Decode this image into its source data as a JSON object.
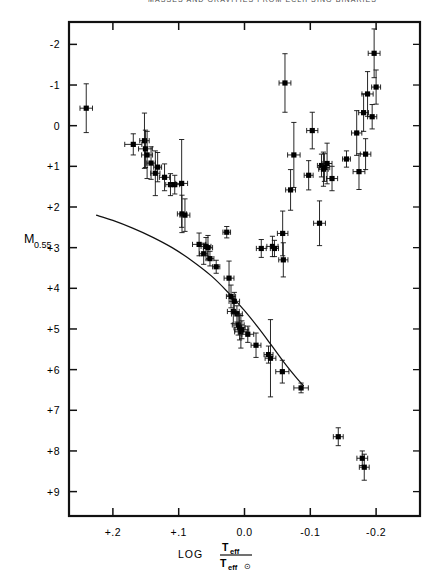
{
  "figure": {
    "running_head": "MASSES AND GRAVITIES FROM ECLIPSING BINARIES",
    "caption": ""
  },
  "axes": {
    "y_label_main": "M",
    "y_label_sub": "0.55",
    "x_label_prefix": "LOG",
    "x_label_num_main": "T",
    "x_label_num_sub": "eff",
    "x_label_den_main": "T",
    "x_label_den_sub": "eff",
    "x_label_den_sun": "⊙",
    "y_ticks": [
      "-2",
      "-1",
      "0",
      "+1",
      "+2",
      "+3",
      "+4",
      "+5",
      "+6",
      "+7",
      "+8",
      "+9"
    ],
    "x_ticks": [
      "+.2",
      "+.1",
      "0.0",
      "-0.1",
      "-0.2"
    ]
  },
  "chart_data": {
    "type": "scatter",
    "title": "",
    "xlabel": "LOG Teff/Teff⊙",
    "ylabel": "M0.55",
    "xlim": [
      0.2667,
      -0.2667
    ],
    "ylim": [
      -2.55,
      9.6
    ],
    "y_inverted": true,
    "grid": false,
    "legend": null,
    "x_tick_values": [
      0.2,
      0.1,
      0.0,
      -0.1,
      -0.2
    ],
    "y_tick_values": [
      -2,
      -1,
      0,
      1,
      2,
      3,
      4,
      5,
      6,
      7,
      8,
      9
    ],
    "series": [
      {
        "name": "eclipsing binaries",
        "marker": "filled-square-with-errorbars",
        "points": [
          {
            "x": 0.2405,
            "y": -0.43,
            "xerr": 0.0095,
            "yerr": 0.6
          },
          {
            "x": 0.169,
            "y": 0.46,
            "xerr": 0.013,
            "yerr": 0.26
          },
          {
            "x": 0.152,
            "y": 0.37,
            "xerr": 0.0072,
            "yerr": 0.68
          },
          {
            "x": 0.1505,
            "y": 0.57,
            "xerr": 0.0105,
            "yerr": 0.46
          },
          {
            "x": 0.148,
            "y": 0.72,
            "xerr": 0.0083,
            "yerr": 0.58
          },
          {
            "x": 0.142,
            "y": 0.92,
            "xerr": 0.0065,
            "yerr": 0.4
          },
          {
            "x": 0.1355,
            "y": 1.17,
            "xerr": 0.007,
            "yerr": 0.55
          },
          {
            "x": 0.132,
            "y": 1.02,
            "xerr": 0.006,
            "yerr": 0.36
          },
          {
            "x": 0.1215,
            "y": 1.27,
            "xerr": 0.0078,
            "yerr": 0.33
          },
          {
            "x": 0.1125,
            "y": 1.45,
            "xerr": 0.0072,
            "yerr": 0.27
          },
          {
            "x": 0.106,
            "y": 1.45,
            "xerr": 0.0075,
            "yerr": 0.23
          },
          {
            "x": 0.0955,
            "y": 1.42,
            "xerr": 0.009,
            "yerr": 1.08
          },
          {
            "x": 0.095,
            "y": 2.17,
            "xerr": 0.007,
            "yerr": 0.46
          },
          {
            "x": 0.0905,
            "y": 2.2,
            "xerr": 0.0075,
            "yerr": 0.4
          },
          {
            "x": 0.069,
            "y": 2.92,
            "xerr": 0.01,
            "yerr": 0.28
          },
          {
            "x": 0.062,
            "y": 3.15,
            "xerr": 0.0062,
            "yerr": 0.26
          },
          {
            "x": 0.0585,
            "y": 2.97,
            "xerr": 0.0075,
            "yerr": 0.22
          },
          {
            "x": 0.0555,
            "y": 3.0,
            "xerr": 0.007,
            "yerr": 0.3
          },
          {
            "x": 0.0525,
            "y": 3.27,
            "xerr": 0.006,
            "yerr": 0.18
          },
          {
            "x": 0.043,
            "y": 3.47,
            "xerr": 0.0055,
            "yerr": 0.16
          },
          {
            "x": 0.027,
            "y": 2.62,
            "xerr": 0.0058,
            "yerr": 0.14
          },
          {
            "x": 0.0235,
            "y": 3.75,
            "xerr": 0.0075,
            "yerr": 0.42
          },
          {
            "x": 0.0205,
            "y": 4.2,
            "xerr": 0.007,
            "yerr": 0.28
          },
          {
            "x": 0.017,
            "y": 4.57,
            "xerr": 0.009,
            "yerr": 0.3
          },
          {
            "x": 0.0155,
            "y": 4.32,
            "xerr": 0.008,
            "yerr": 0.22
          },
          {
            "x": 0.0115,
            "y": 4.63,
            "xerr": 0.0082,
            "yerr": 0.2
          },
          {
            "x": 0.0095,
            "y": 4.9,
            "xerr": 0.009,
            "yerr": 0.25
          },
          {
            "x": 0.0075,
            "y": 4.97,
            "xerr": 0.0085,
            "yerr": 0.3
          },
          {
            "x": 0.0055,
            "y": 5.07,
            "xerr": 0.0095,
            "yerr": 0.4
          },
          {
            "x": 0.004,
            "y": 5.02,
            "xerr": 0.0105,
            "yerr": 0.22
          },
          {
            "x": -0.005,
            "y": 5.13,
            "xerr": 0.009,
            "yerr": 0.2
          },
          {
            "x": -0.0175,
            "y": 5.4,
            "xerr": 0.0075,
            "yerr": 0.3
          },
          {
            "x": -0.0255,
            "y": 3.02,
            "xerr": 0.0075,
            "yerr": 0.22
          },
          {
            "x": -0.0365,
            "y": 5.63,
            "xerr": 0.0068,
            "yerr": 0.21
          },
          {
            "x": -0.0395,
            "y": 5.72,
            "xerr": 0.0082,
            "yerr": 0.95
          },
          {
            "x": -0.0425,
            "y": 2.97,
            "xerr": 0.0085,
            "yerr": 0.25
          },
          {
            "x": -0.0455,
            "y": 3.02,
            "xerr": 0.0062,
            "yerr": 0.2
          },
          {
            "x": -0.0575,
            "y": 6.05,
            "xerr": 0.01,
            "yerr": 0.28
          },
          {
            "x": -0.058,
            "y": 2.65,
            "xerr": 0.008,
            "yerr": 0.55
          },
          {
            "x": -0.059,
            "y": 3.3,
            "xerr": 0.007,
            "yerr": 0.42
          },
          {
            "x": -0.0615,
            "y": -1.05,
            "xerr": 0.009,
            "yerr": 0.72
          },
          {
            "x": -0.07,
            "y": 1.58,
            "xerr": 0.0075,
            "yerr": 0.5
          },
          {
            "x": -0.075,
            "y": 0.72,
            "xerr": 0.0095,
            "yerr": 0.8
          },
          {
            "x": -0.086,
            "y": 6.45,
            "xerr": 0.011,
            "yerr": 0.12
          },
          {
            "x": -0.0975,
            "y": 1.22,
            "xerr": 0.0068,
            "yerr": 0.36
          },
          {
            "x": -0.103,
            "y": 0.12,
            "xerr": 0.0085,
            "yerr": 0.45
          },
          {
            "x": -0.114,
            "y": 2.4,
            "xerr": 0.009,
            "yerr": 0.55
          },
          {
            "x": -0.117,
            "y": 0.98,
            "xerr": 0.0062,
            "yerr": 0.28
          },
          {
            "x": -0.12,
            "y": 1.07,
            "xerr": 0.0072,
            "yerr": 0.42
          },
          {
            "x": -0.1215,
            "y": 1.03,
            "xerr": 0.008,
            "yerr": 0.34
          },
          {
            "x": -0.1255,
            "y": 0.93,
            "xerr": 0.0075,
            "yerr": 0.5
          },
          {
            "x": -0.133,
            "y": 1.3,
            "xerr": 0.0085,
            "yerr": 0.3
          },
          {
            "x": -0.1425,
            "y": 7.65,
            "xerr": 0.0075,
            "yerr": 0.22
          },
          {
            "x": -0.155,
            "y": 0.82,
            "xerr": 0.006,
            "yerr": 0.2
          },
          {
            "x": -0.1705,
            "y": 0.18,
            "xerr": 0.0078,
            "yerr": 0.55
          },
          {
            "x": -0.174,
            "y": 1.13,
            "xerr": 0.009,
            "yerr": 0.44
          },
          {
            "x": -0.179,
            "y": 8.18,
            "xerr": 0.0082,
            "yerr": 0.18
          },
          {
            "x": -0.181,
            "y": -0.32,
            "xerr": 0.0075,
            "yerr": 0.46
          },
          {
            "x": -0.182,
            "y": 8.4,
            "xerr": 0.0075,
            "yerr": 0.32
          },
          {
            "x": -0.184,
            "y": 0.7,
            "xerr": 0.008,
            "yerr": 0.38
          },
          {
            "x": -0.187,
            "y": -0.78,
            "xerr": 0.0085,
            "yerr": 0.55
          },
          {
            "x": -0.194,
            "y": -0.22,
            "xerr": 0.007,
            "yerr": 0.3
          },
          {
            "x": -0.197,
            "y": -1.78,
            "xerr": 0.009,
            "yerr": 0.6
          },
          {
            "x": -0.2,
            "y": -0.95,
            "xerr": 0.0068,
            "yerr": 0.42
          }
        ]
      }
    ],
    "curve": {
      "name": "main-sequence relation",
      "points": [
        {
          "x": 0.2255,
          "y": 2.2
        },
        {
          "x": 0.2,
          "y": 2.33
        },
        {
          "x": 0.17,
          "y": 2.52
        },
        {
          "x": 0.14,
          "y": 2.74
        },
        {
          "x": 0.11,
          "y": 3.0
        },
        {
          "x": 0.08,
          "y": 3.32
        },
        {
          "x": 0.05,
          "y": 3.7
        },
        {
          "x": 0.025,
          "y": 4.1
        },
        {
          "x": 0.0,
          "y": 4.55
        },
        {
          "x": -0.02,
          "y": 4.95
        },
        {
          "x": -0.04,
          "y": 5.38
        },
        {
          "x": -0.06,
          "y": 5.82
        },
        {
          "x": -0.08,
          "y": 6.22
        },
        {
          "x": -0.09,
          "y": 6.4
        }
      ]
    }
  }
}
